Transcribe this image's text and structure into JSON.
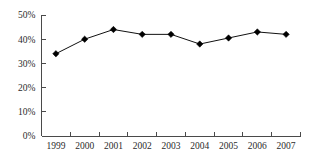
{
  "chart_data": {
    "type": "line",
    "title": "",
    "subtitle": "",
    "xlabel": "",
    "ylabel": "",
    "categories": [
      "1999",
      "2000",
      "2001",
      "2002",
      "2003",
      "2004",
      "2005",
      "2006",
      "2007"
    ],
    "values": [
      34,
      40,
      44,
      42,
      42,
      38,
      40.5,
      43,
      42
    ],
    "series": [
      {
        "name": "",
        "values": [
          34,
          40,
          44,
          42,
          42,
          38,
          40.5,
          43,
          42
        ]
      }
    ],
    "ylim": [
      0,
      50
    ],
    "y_ticks": [
      0,
      10,
      20,
      30,
      40,
      50
    ],
    "y_tick_labels": [
      "0%",
      "10%",
      "20%",
      "30%",
      "40%",
      "50%"
    ],
    "x_tick_labels": [
      "1999",
      "2000",
      "2001",
      "2002",
      "2003",
      "2004",
      "2005",
      "2006",
      "2007"
    ],
    "grid": false,
    "legend": false,
    "legend_position": "none",
    "marker": "diamond",
    "line_color": "#111111",
    "marker_color": "#000000",
    "axis_color": "#4a4a4a",
    "background_color": "#ffffff"
  }
}
